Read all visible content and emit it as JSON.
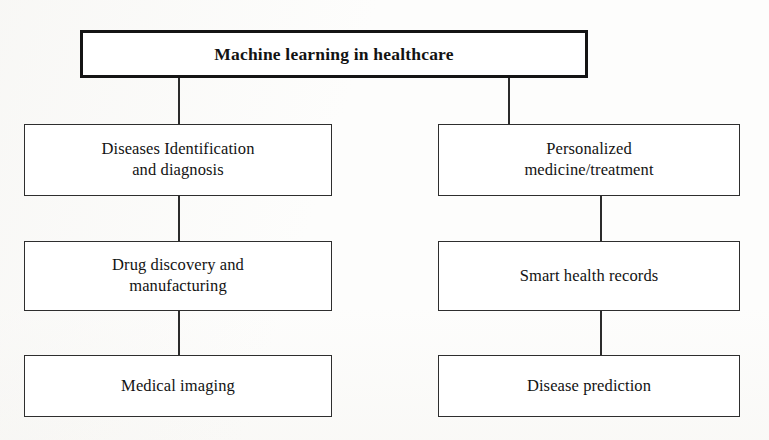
{
  "diagram": {
    "title_node": {
      "label": "Machine learning in healthcare"
    },
    "branches": [
      {
        "column": "left",
        "nodes": [
          {
            "label": "Diseases Identification\nand diagnosis"
          },
          {
            "label": "Drug discovery and\nmanufacturing"
          },
          {
            "label": "Medical imaging"
          }
        ]
      },
      {
        "column": "right",
        "nodes": [
          {
            "label": "Personalized\nmedicine/treatment"
          },
          {
            "label": "Smart health records"
          },
          {
            "label": "Disease prediction"
          }
        ]
      }
    ],
    "colors": {
      "background": "#fdfdfc",
      "box_fill": "#ffffff",
      "border": "#2e2e2e",
      "title_border": "#141414",
      "connector": "#2b2b2b",
      "text": "#131313"
    }
  }
}
